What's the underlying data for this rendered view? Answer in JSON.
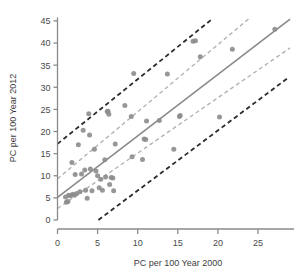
{
  "chart_data": {
    "type": "scatter",
    "title": "",
    "xlabel": "PC per 100 Year 2000",
    "ylabel": "PC per 100 Year 2012",
    "xlim": [
      0,
      29.5
    ],
    "ylim": [
      0,
      45.8
    ],
    "grid": false,
    "legend": null,
    "xticks": [
      0,
      5,
      10,
      15,
      20,
      25
    ],
    "yticks": [
      0,
      5,
      10,
      15,
      20,
      25,
      30,
      35,
      40,
      45
    ],
    "xtick_labels": [
      "0",
      "5",
      "10",
      "15",
      "20",
      "25"
    ],
    "ytick_labels": [
      "0",
      "5",
      "10",
      "15",
      "20",
      "25",
      "30",
      "35",
      "40",
      "45"
    ],
    "marker": {
      "shape": "circle",
      "color": "#8c8c8c",
      "size_px": 5,
      "opacity": 0.9
    },
    "points": [
      {
        "x": 1.0,
        "y": 5.2
      },
      {
        "x": 1.1,
        "y": 4.0
      },
      {
        "x": 1.3,
        "y": 4.2
      },
      {
        "x": 1.4,
        "y": 5.6
      },
      {
        "x": 1.6,
        "y": 5.5
      },
      {
        "x": 1.8,
        "y": 13.0
      },
      {
        "x": 1.9,
        "y": 5.8
      },
      {
        "x": 2.1,
        "y": 5.6
      },
      {
        "x": 2.2,
        "y": 10.3
      },
      {
        "x": 2.4,
        "y": 6.0
      },
      {
        "x": 2.6,
        "y": 17.0
      },
      {
        "x": 2.8,
        "y": 6.4
      },
      {
        "x": 3.0,
        "y": 10.4
      },
      {
        "x": 3.2,
        "y": 20.3
      },
      {
        "x": 3.4,
        "y": 11.3
      },
      {
        "x": 3.5,
        "y": 6.7
      },
      {
        "x": 3.7,
        "y": 4.9
      },
      {
        "x": 3.9,
        "y": 24.0
      },
      {
        "x": 4.0,
        "y": 19.2
      },
      {
        "x": 4.1,
        "y": 11.5
      },
      {
        "x": 4.3,
        "y": 6.6
      },
      {
        "x": 4.6,
        "y": 16.0
      },
      {
        "x": 4.8,
        "y": 11.1
      },
      {
        "x": 5.0,
        "y": 10.0
      },
      {
        "x": 5.2,
        "y": 7.3
      },
      {
        "x": 5.4,
        "y": 9.2
      },
      {
        "x": 5.6,
        "y": 6.7
      },
      {
        "x": 5.9,
        "y": 13.6
      },
      {
        "x": 6.0,
        "y": 9.7
      },
      {
        "x": 6.2,
        "y": 24.5
      },
      {
        "x": 6.3,
        "y": 24.6
      },
      {
        "x": 6.4,
        "y": 23.9
      },
      {
        "x": 6.5,
        "y": 8.0
      },
      {
        "x": 6.7,
        "y": 9.6
      },
      {
        "x": 6.9,
        "y": 9.5
      },
      {
        "x": 7.0,
        "y": 6.6
      },
      {
        "x": 7.2,
        "y": 17.2
      },
      {
        "x": 8.4,
        "y": 25.9
      },
      {
        "x": 9.2,
        "y": 23.4
      },
      {
        "x": 9.3,
        "y": 14.3
      },
      {
        "x": 9.5,
        "y": 33.1
      },
      {
        "x": 10.6,
        "y": 13.7
      },
      {
        "x": 10.8,
        "y": 18.3
      },
      {
        "x": 11.0,
        "y": 18.2
      },
      {
        "x": 11.1,
        "y": 22.4
      },
      {
        "x": 12.7,
        "y": 22.5
      },
      {
        "x": 13.7,
        "y": 33.0
      },
      {
        "x": 14.5,
        "y": 16.0
      },
      {
        "x": 15.2,
        "y": 23.4
      },
      {
        "x": 15.3,
        "y": 23.6
      },
      {
        "x": 16.9,
        "y": 40.4
      },
      {
        "x": 17.2,
        "y": 40.5
      },
      {
        "x": 17.8,
        "y": 36.9
      },
      {
        "x": 20.2,
        "y": 23.3
      },
      {
        "x": 21.8,
        "y": 38.6
      },
      {
        "x": 27.1,
        "y": 43.1
      }
    ],
    "lines": [
      {
        "name": "regression-line",
        "style": "solid",
        "color": "#8a8a8a",
        "width_px": 1.6,
        "x0": 0.0,
        "y0": 5.1,
        "x1": 29.0,
        "y1": 45.4
      },
      {
        "name": "inner-confidence-upper",
        "style": "dashed",
        "color": "#b4b4b4",
        "width_px": 1.4,
        "x0": 0.0,
        "y0": 9.3,
        "x1": 24.0,
        "y1": 45.7
      },
      {
        "name": "inner-confidence-lower",
        "style": "dashed",
        "color": "#b4b4b4",
        "width_px": 1.4,
        "x0": 0.0,
        "y0": 2.6,
        "x1": 29.0,
        "y1": 38.9
      },
      {
        "name": "outer-prediction-upper",
        "style": "dashed",
        "color": "#2b2b2b",
        "width_px": 1.8,
        "x0": 0.0,
        "y0": 17.2,
        "x1": 19.4,
        "y1": 45.6
      },
      {
        "name": "outer-prediction-lower",
        "style": "dashed",
        "color": "#2b2b2b",
        "width_px": 1.8,
        "x0": 5.1,
        "y0": 0.0,
        "x1": 28.8,
        "y1": 32.2
      }
    ]
  },
  "axes": {
    "axis_color": "#8a8a8a",
    "text_color": "#3d3d3d"
  }
}
